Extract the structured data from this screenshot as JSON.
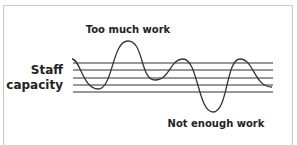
{
  "diagram": {
    "labels": {
      "top": "Too much work",
      "left_line1": "Staff",
      "left_line2": "capacity",
      "bottom": "Not enough work"
    },
    "capacity_band": {
      "line_count": 5,
      "description": "Horizontal lines representing staff capacity"
    },
    "curve": {
      "description": "Workload fluctuating above and below staff capacity",
      "points": [
        [
          72,
          59
        ],
        [
          98,
          89
        ],
        [
          128,
          41
        ],
        [
          155,
          80
        ],
        [
          183,
          59
        ],
        [
          213,
          112
        ],
        [
          240,
          59
        ],
        [
          272,
          87
        ]
      ]
    },
    "colors": {
      "line": "#333333",
      "frame": "#c9c9c9",
      "text": "#222222"
    }
  }
}
